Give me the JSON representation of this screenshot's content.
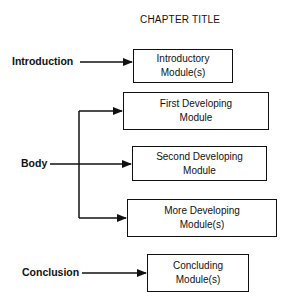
{
  "diagram": {
    "title": "CHAPTER TITLE",
    "sections": {
      "introduction": "Introduction",
      "body": "Body",
      "conclusion": "Conclusion"
    },
    "modules": {
      "introductory": {
        "line1": "Introductory",
        "line2": "Module(s)"
      },
      "first": {
        "line1": "First Developing",
        "line2": "Module"
      },
      "second": {
        "line1": "Second Developing",
        "line2": "Module"
      },
      "more": {
        "line1": "More Developing",
        "line2": "Module(s)"
      },
      "concluding": {
        "line1": "Concluding",
        "line2": "Module(s)"
      }
    }
  }
}
